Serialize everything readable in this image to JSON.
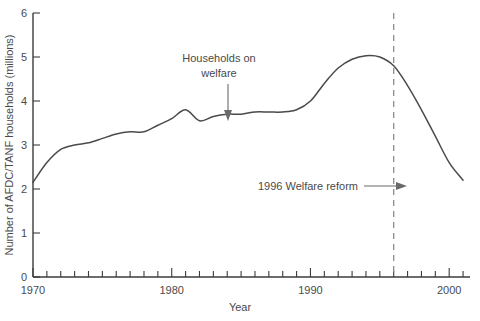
{
  "chart_data": {
    "type": "line",
    "title": "",
    "xlabel": "Year",
    "ylabel": "Number of AFDC/TANF households (millions)",
    "xlim": [
      1970,
      2001.5
    ],
    "ylim": [
      0,
      6
    ],
    "grid": false,
    "legend": "none",
    "x_ticks_labeled": [
      "1970",
      "1980",
      "1990",
      "2000"
    ],
    "x_tick_values_labeled": [
      1970,
      1980,
      1990,
      2000
    ],
    "x_tick_interval_minor": 1,
    "y_ticks": [
      "0",
      "1",
      "2",
      "3",
      "4",
      "5",
      "6"
    ],
    "y_tick_values": [
      0,
      1,
      2,
      3,
      4,
      5,
      6
    ],
    "series": [
      {
        "name": "Households on welfare",
        "x": [
          1970,
          1971,
          1972,
          1973,
          1974,
          1975,
          1976,
          1977,
          1978,
          1979,
          1980,
          1981,
          1982,
          1983,
          1984,
          1985,
          1986,
          1987,
          1988,
          1989,
          1990,
          1991,
          1992,
          1993,
          1994,
          1995,
          1996,
          1997,
          1998,
          1999,
          2000,
          2001
        ],
        "values": [
          2.15,
          2.6,
          2.9,
          3.0,
          3.05,
          3.15,
          3.25,
          3.3,
          3.3,
          3.45,
          3.6,
          3.8,
          3.55,
          3.65,
          3.7,
          3.7,
          3.75,
          3.75,
          3.75,
          3.8,
          4.0,
          4.4,
          4.75,
          4.95,
          5.03,
          5.0,
          4.8,
          4.35,
          3.8,
          3.2,
          2.6,
          2.2
        ]
      }
    ],
    "annotations": [
      {
        "id": "households-annotation",
        "text_line1": "Households on",
        "text_line2": "welfare",
        "arrow": "down",
        "points_to_year": 1983.5,
        "points_to_value": 3.65
      },
      {
        "id": "welfare-reform-annotation",
        "text": "1996 Welfare reform",
        "arrow": "right",
        "points_to_year": 1996,
        "points_to_value": 2.1
      }
    ],
    "event_lines": [
      {
        "id": "welfare-reform-line",
        "label": "1996",
        "year": 1996,
        "style": "dashed",
        "color": "#8c8c8c"
      }
    ],
    "colors": {
      "line": "#4a4a4a",
      "axis": "#3b3b3b",
      "event": "#8c8c8c",
      "text": "#4a4a4a",
      "background": "#ffffff"
    }
  }
}
